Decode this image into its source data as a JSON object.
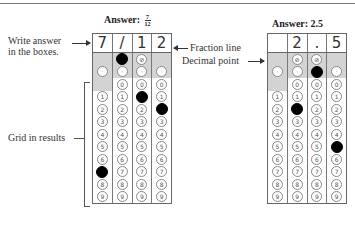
{
  "page": {
    "top_fragment": "in boxes."
  },
  "left_grid": {
    "title_prefix": "Answer:",
    "fraction": {
      "numerator": "7",
      "denominator": "12"
    },
    "boxes": [
      "7",
      "/",
      "1",
      "2"
    ],
    "slash_row": [
      {
        "type": "none"
      },
      {
        "type": "bubble",
        "label": "/",
        "filled": true
      },
      {
        "type": "bubble",
        "label": "⊘",
        "filled": false
      },
      {
        "type": "none"
      }
    ],
    "decimal_row": [
      {
        "label": "·",
        "filled": false
      },
      {
        "label": "·",
        "filled": false
      },
      {
        "label": "·",
        "filled": false
      },
      {
        "label": "·",
        "filled": false
      }
    ],
    "digits": [
      "0",
      "1",
      "2",
      "3",
      "4",
      "5",
      "6",
      "7",
      "8",
      "9"
    ],
    "first_col_has_zero": false,
    "filled": {
      "0": "7",
      "1": "/",
      "2": "1",
      "3": "2"
    }
  },
  "right_grid": {
    "title": "Answer: 2.5",
    "boxes": [
      "",
      "2",
      ".",
      "5"
    ],
    "slash_row": [
      {
        "type": "none"
      },
      {
        "type": "bubble",
        "label": "⊘",
        "filled": false
      },
      {
        "type": "bubble",
        "label": "⊘",
        "filled": false
      },
      {
        "type": "none"
      }
    ],
    "decimal_row": [
      {
        "label": "·",
        "filled": false
      },
      {
        "label": "·",
        "filled": false
      },
      {
        "label": "·",
        "filled": true
      },
      {
        "label": "·",
        "filled": false
      }
    ],
    "digits": [
      "0",
      "1",
      "2",
      "3",
      "4",
      "5",
      "6",
      "7",
      "8",
      "9"
    ],
    "first_col_has_zero": false,
    "filled": {
      "1": "2",
      "2": ".",
      "3": "5"
    }
  },
  "annotations": {
    "write_answer": [
      "Write answer",
      "in the boxes."
    ],
    "fraction_line": "Fraction line",
    "decimal_point": "Decimal point",
    "grid_in_results": "Grid in results"
  }
}
